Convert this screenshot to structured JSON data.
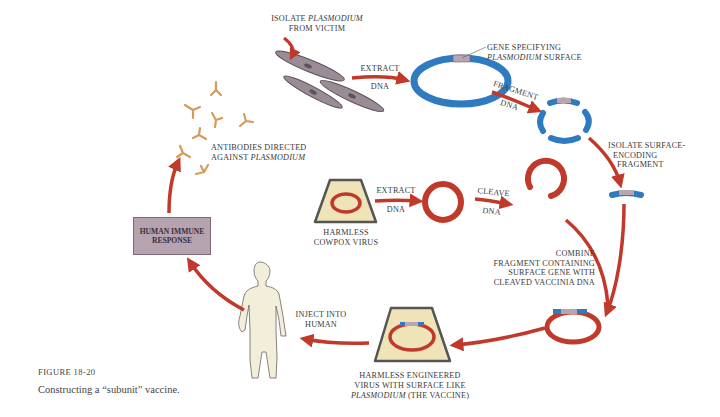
{
  "figure": {
    "number": "FIGURE 18-20",
    "caption": "Constructing a “subunit” vaccine."
  },
  "labels": {
    "isolate_line1_a": "ISOLATE ",
    "isolate_line1_b": "PLASMODIUM",
    "isolate_line2": "FROM VICTIM",
    "extract1_top": "EXTRACT",
    "extract1_bottom": "DNA",
    "gene_line1": "GENE SPECIFYING",
    "gene_line2_a": "PLASMODIUM",
    "gene_line2_b": " SURFACE",
    "fragment_top": "FRAGMENT",
    "fragment_bottom": "DNA",
    "isolate_surface_1": "ISOLATE SURFACE-",
    "isolate_surface_2": "ENCODING",
    "isolate_surface_3": "FRAGMENT",
    "antibodies_1": "ANTIBODIES DIRECTED",
    "antibodies_2_a": "AGAINST ",
    "antibodies_2_b": "PLASMODIUM",
    "cowpox_1": "HARMLESS",
    "cowpox_2": "COWPOX VIRUS",
    "extract2_top": "EXTRACT",
    "extract2_bottom": "DNA",
    "cleave_top": "CLEAVE",
    "cleave_bottom": "DNA",
    "combine_1": "COMBINE",
    "combine_2": "FRAGMENT CONTAINING",
    "combine_3": "SURFACE GENE WITH",
    "combine_4": "CLEAVED VACCINIA DNA",
    "immune_1": "HUMAN IMMUNE",
    "immune_2": "RESPONSE",
    "inject_1": "INJECT INTO",
    "inject_2": "HUMAN",
    "vaccine_1": "HARMLESS ENGINEERED",
    "vaccine_2": "VIRUS WITH SURFACE LIKE",
    "vaccine_3_a": "PLASMODIUM",
    "vaccine_3_b": " (THE VACCINE)"
  },
  "colors": {
    "arrow_red": "#c0392b",
    "plasmid_blue": "#2f7bbf",
    "gene_mauve": "#b9a4b2",
    "virus_tan": "#efe3b8",
    "human_skin": "#f3eed9",
    "cell_gray": "#9a8c96",
    "antibody_orange": "#d79a5a",
    "immune_box": "#b6a3b0"
  }
}
